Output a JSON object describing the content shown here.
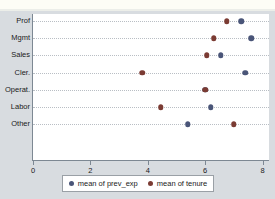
{
  "chart_data": {
    "type": "scatter",
    "title": "",
    "xlabel": "",
    "ylabel": "",
    "categories": [
      "Prof",
      "Mgmt",
      "Sales",
      "Cler.",
      "Operat.",
      "Labor",
      "Other"
    ],
    "series": [
      {
        "name": "mean of prev_exp",
        "color": "#4a5578",
        "values": [
          7.25,
          7.6,
          6.55,
          7.4,
          6.0,
          6.2,
          5.4
        ]
      },
      {
        "name": "mean of tenure",
        "color": "#7b3b33",
        "values": [
          6.75,
          6.3,
          6.05,
          3.8,
          6.0,
          4.45,
          7.0
        ]
      }
    ],
    "xticks": [
      "0",
      "2",
      "4",
      "6",
      "8"
    ],
    "xtick_values": [
      0,
      2,
      4,
      6,
      8
    ],
    "xlim": [
      0,
      8.25
    ],
    "grid": "horizontal-dotted",
    "legend_position": "bottom"
  },
  "legend": {
    "items": [
      {
        "label": "mean of prev_exp",
        "color": "#4a5578"
      },
      {
        "label": "mean of tenure",
        "color": "#7b3b33"
      }
    ]
  },
  "colors": {
    "figure_background": "#d8dce0",
    "plot_background": "#ffffff",
    "axis": "#7d8893",
    "grid": "#b9bec4",
    "prev_exp": "#4a5578",
    "tenure": "#7b3b33"
  }
}
